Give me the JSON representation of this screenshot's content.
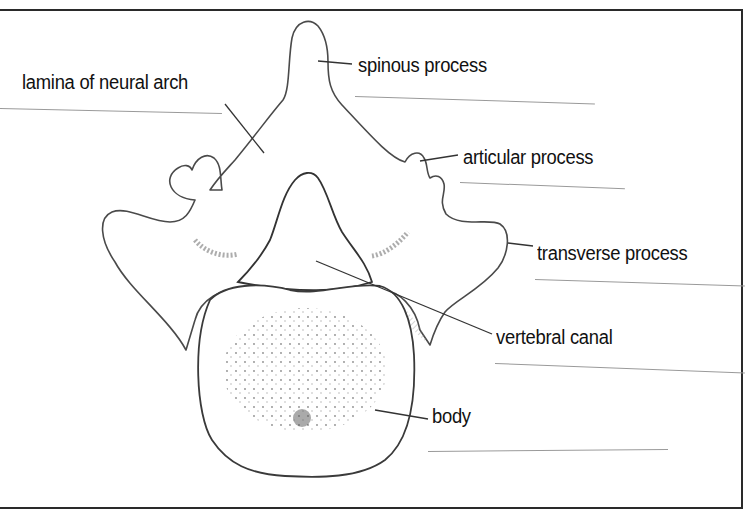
{
  "diagram": {
    "accent_colors": {
      "outline": "#4a4a4a",
      "text": "#111111",
      "frame": "#2a2a2a",
      "answer_line": "#9a9a9a"
    },
    "labels": [
      {
        "id": "spinous",
        "text": "spinous process"
      },
      {
        "id": "lamina",
        "text": "lamina of neural arch"
      },
      {
        "id": "articular",
        "text": "articular process"
      },
      {
        "id": "transverse",
        "text": "transverse process"
      },
      {
        "id": "canal",
        "text": "vertebral canal"
      },
      {
        "id": "body",
        "text": "body"
      }
    ]
  }
}
